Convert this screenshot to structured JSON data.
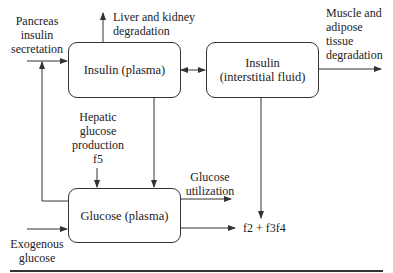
{
  "nodes": {
    "insulin_plasma": {
      "label": "Insulin (plasma)"
    },
    "insulin_interstitial": {
      "line1": "Insulin",
      "line2": "(interstitial fluid)"
    },
    "glucose_plasma": {
      "label": "Glucose (plasma)"
    }
  },
  "labels": {
    "pancreas": [
      "Pancreas",
      "insulin",
      "secretation"
    ],
    "liver": [
      "Liver and kidney",
      "degradation"
    ],
    "muscle": [
      "Muscle and",
      "adipose",
      "tissue",
      "degradation"
    ],
    "hepatic": [
      "Hepatic",
      "glucose",
      "production",
      "f5"
    ],
    "glucose_utilization": [
      "Glucose",
      "utilization"
    ],
    "f_output": "f2 + f3f4",
    "exogenous": [
      "Exogenous",
      "glucose"
    ]
  },
  "colors": {
    "line": "#333333",
    "text": "#222222",
    "background": "#ffffff"
  }
}
